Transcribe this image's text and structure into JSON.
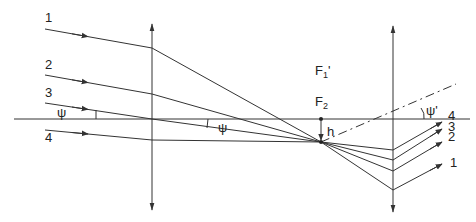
{
  "diagram": {
    "title": "",
    "colors": {
      "line": "#333333",
      "background": "#ffffff"
    },
    "optical_axis": {
      "y": 119,
      "x1": 14,
      "x2": 470
    },
    "lenses": [
      {
        "name": "lens-1",
        "x": 152,
        "y_top": 24,
        "y_bottom": 210
      },
      {
        "name": "lens-2",
        "x": 393,
        "y_top": 26,
        "y_bottom": 212
      }
    ],
    "rays": [
      {
        "label": "1",
        "points": [
          [
            45,
            29
          ],
          [
            152,
            48
          ],
          [
            393,
            190
          ],
          [
            442,
            164
          ]
        ],
        "label_in": [
          48,
          22
        ],
        "label_out": [
          452,
          191
        ]
      },
      {
        "label": "2",
        "points": [
          [
            45,
            75
          ],
          [
            152,
            94
          ],
          [
            393,
            171
          ],
          [
            442,
            142
          ]
        ],
        "label_in": [
          48,
          68
        ],
        "label_out": [
          452,
          144
        ]
      },
      {
        "label": "3",
        "points": [
          [
            45,
            103
          ],
          [
            152,
            119
          ],
          [
            393,
            160
          ],
          [
            442,
            129
          ]
        ],
        "label_in": [
          48,
          96
        ],
        "label_out": [
          452,
          134
        ]
      },
      {
        "label": "4",
        "points": [
          [
            45,
            130
          ],
          [
            152,
            140
          ],
          [
            393,
            150
          ],
          [
            442,
            122
          ]
        ],
        "label_in": [
          48,
          141
        ],
        "label_out": [
          452,
          124
        ]
      }
    ],
    "labels": {
      "psi_left": "ψ",
      "psi_mid": "ψ",
      "psi_prime": "ψ'",
      "f1_prime": "F",
      "f1_prime_sub": "1",
      "f1_prime_mark": "'",
      "f2": "F",
      "f2_sub": "2",
      "h": "h",
      "ray_in": [
        "1",
        "2",
        "3",
        "4"
      ],
      "ray_out": [
        "4",
        "3",
        "2",
        "1"
      ]
    },
    "focal_point": {
      "x": 321,
      "y": 119
    },
    "convergence_point": {
      "x": 321,
      "y": 142
    },
    "dash_dot_line": {
      "x1": 321,
      "y1": 142,
      "x2": 454,
      "y2": 85
    }
  }
}
